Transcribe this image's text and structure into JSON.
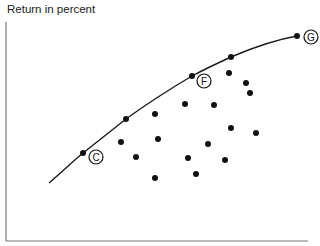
{
  "chart_data": {
    "type": "scatter",
    "title": "",
    "xlabel": "",
    "ylabel": "Return in percent",
    "grid": false,
    "legend": null,
    "axes": {
      "x_ticks": [],
      "y_ticks": []
    },
    "efficient_frontier": {
      "name": "efficient frontier curve",
      "points": [
        [
          49,
          183
        ],
        [
          83,
          153
        ],
        [
          126,
          119
        ],
        [
          192,
          76
        ],
        [
          231,
          57
        ],
        [
          297,
          36
        ]
      ]
    },
    "labeled_points": [
      {
        "label": "C",
        "point": [
          83,
          153
        ],
        "label_pos": [
          96,
          157
        ]
      },
      {
        "label": "F",
        "point": [
          192,
          76
        ],
        "label_pos": [
          204,
          81
        ]
      },
      {
        "label": "G",
        "point": [
          297,
          36
        ],
        "label_pos": [
          311,
          37
        ]
      }
    ],
    "frontier_dots": [
      [
        126,
        119
      ],
      [
        231,
        57
      ]
    ],
    "interior_dots": [
      [
        155,
        114
      ],
      [
        121,
        142
      ],
      [
        158,
        139
      ],
      [
        136,
        157
      ],
      [
        155,
        178
      ],
      [
        185,
        104
      ],
      [
        214,
        105
      ],
      [
        229,
        73
      ],
      [
        246,
        83
      ],
      [
        250,
        93
      ],
      [
        231,
        128
      ],
      [
        256,
        133
      ],
      [
        208,
        144
      ],
      [
        188,
        158
      ],
      [
        225,
        160
      ],
      [
        196,
        174
      ]
    ]
  },
  "labels": {
    "ylabel": "Return in percent",
    "c": "C",
    "f": "F",
    "g": "G"
  }
}
